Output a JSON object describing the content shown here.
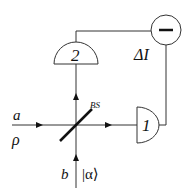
{
  "diagram": {
    "labels": {
      "input_a": "a",
      "input_a_state": "ρ",
      "input_b": "b",
      "input_b_state": "|α⟩",
      "beam_splitter": "BS",
      "detector_1": "1",
      "detector_2": "2",
      "difference": "ΔI",
      "subtractor_symbol": "−"
    },
    "components": [
      {
        "id": "beam-splitter",
        "type": "beam-splitter",
        "label": "BS"
      },
      {
        "id": "detector-1",
        "type": "photodetector",
        "label": "1"
      },
      {
        "id": "detector-2",
        "type": "photodetector",
        "label": "2"
      },
      {
        "id": "subtractor",
        "type": "difference-node",
        "label": "−",
        "output": "ΔI"
      }
    ],
    "colors": {
      "line": "#333333",
      "text": "#111111",
      "background": "#ffffff"
    }
  }
}
